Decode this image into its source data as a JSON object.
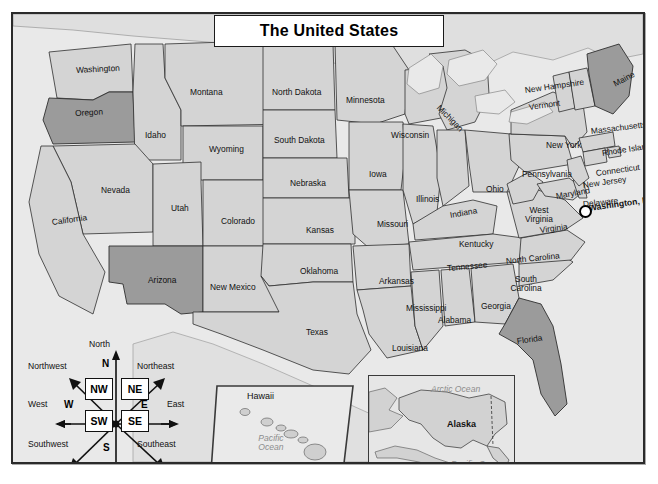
{
  "title": "The United States",
  "map": {
    "frame_color": "#2b2b2b",
    "ocean_color": "#e9e9e9",
    "land_color": "#d4d4d4",
    "highlight_color": "#9b9b9b",
    "highlighted_states": [
      "Oregon",
      "Arizona",
      "Maine",
      "Florida"
    ]
  },
  "states": [
    {
      "name": "Washington",
      "x": 63,
      "y": 52,
      "rot": -3
    },
    {
      "name": "Oregon",
      "x": 62,
      "y": 95,
      "rot": -3
    },
    {
      "name": "Idaho",
      "x": 132,
      "y": 117,
      "rot": 0
    },
    {
      "name": "Montana",
      "x": 177,
      "y": 74,
      "rot": 0
    },
    {
      "name": "Wyoming",
      "x": 196,
      "y": 131,
      "rot": 0
    },
    {
      "name": "Nevada",
      "x": 88,
      "y": 172,
      "rot": 0
    },
    {
      "name": "California",
      "x": 39,
      "y": 204,
      "rot": -8
    },
    {
      "name": "Utah",
      "x": 158,
      "y": 190,
      "rot": 0
    },
    {
      "name": "Colorado",
      "x": 208,
      "y": 203,
      "rot": 0
    },
    {
      "name": "Arizona",
      "x": 135,
      "y": 262,
      "rot": 0
    },
    {
      "name": "New Mexico",
      "x": 197,
      "y": 269,
      "rot": 0
    },
    {
      "name": "North Dakota",
      "x": 259,
      "y": 74,
      "rot": 0
    },
    {
      "name": "South Dakota",
      "x": 261,
      "y": 122,
      "rot": 0
    },
    {
      "name": "Nebraska",
      "x": 277,
      "y": 165,
      "rot": 0
    },
    {
      "name": "Kansas",
      "x": 293,
      "y": 212,
      "rot": 0
    },
    {
      "name": "Oklahoma",
      "x": 287,
      "y": 253,
      "rot": 0
    },
    {
      "name": "Texas",
      "x": 293,
      "y": 314,
      "rot": 0
    },
    {
      "name": "Minnesota",
      "x": 333,
      "y": 82,
      "rot": 0
    },
    {
      "name": "Iowa",
      "x": 356,
      "y": 156,
      "rot": 0
    },
    {
      "name": "Missouri",
      "x": 364,
      "y": 206,
      "rot": 0
    },
    {
      "name": "Arkansas",
      "x": 366,
      "y": 263,
      "rot": 0
    },
    {
      "name": "Louisiana",
      "x": 379,
      "y": 330,
      "rot": 0
    },
    {
      "name": "Wisconsin",
      "x": 378,
      "y": 117,
      "rot": 0
    },
    {
      "name": "Illinois",
      "x": 403,
      "y": 181,
      "rot": 0
    },
    {
      "name": "Michigan",
      "x": 425,
      "y": 88,
      "rot": 45
    },
    {
      "name": "Indiana",
      "x": 437,
      "y": 197,
      "rot": -10
    },
    {
      "name": "Ohio",
      "x": 473,
      "y": 171,
      "rot": 0
    },
    {
      "name": "Kentucky",
      "x": 446,
      "y": 226,
      "rot": 0
    },
    {
      "name": "Tennessee",
      "x": 434,
      "y": 250,
      "rot": -5
    },
    {
      "name": "Mississippi",
      "x": 393,
      "y": 290,
      "rot": 0
    },
    {
      "name": "Alabama",
      "x": 425,
      "y": 302,
      "rot": 0
    },
    {
      "name": "Georgia",
      "x": 468,
      "y": 288,
      "rot": 0
    },
    {
      "name": "Florida",
      "x": 504,
      "y": 323,
      "rot": -8
    },
    {
      "name": "South Carolina",
      "x": 492,
      "y": 261,
      "rot": 0,
      "two": true
    },
    {
      "name": "North Carolina",
      "x": 493,
      "y": 243,
      "rot": -6
    },
    {
      "name": "Virginia",
      "x": 527,
      "y": 212,
      "rot": -8
    },
    {
      "name": "West Virginia",
      "x": 505,
      "y": 192,
      "rot": 0,
      "two": true
    },
    {
      "name": "Pennsylvania",
      "x": 509,
      "y": 156,
      "rot": 0
    },
    {
      "name": "Maryland",
      "x": 543,
      "y": 178,
      "rot": -10
    },
    {
      "name": "Delaware",
      "x": 570,
      "y": 186,
      "rot": -6
    },
    {
      "name": "New Jersey",
      "x": 570,
      "y": 167,
      "rot": -8
    },
    {
      "name": "New York",
      "x": 533,
      "y": 127,
      "rot": 0
    },
    {
      "name": "Connecticut",
      "x": 583,
      "y": 155,
      "rot": -8
    },
    {
      "name": "Rhode Island",
      "x": 589,
      "y": 135,
      "rot": -9
    },
    {
      "name": "Massachusetts",
      "x": 578,
      "y": 113,
      "rot": -7
    },
    {
      "name": "Vermont",
      "x": 516,
      "y": 89,
      "rot": -8
    },
    {
      "name": "New Hampshire",
      "x": 512,
      "y": 72,
      "rot": -8
    },
    {
      "name": "Maine",
      "x": 601,
      "y": 66,
      "rot": -28
    }
  ],
  "capital": {
    "label": "Washington, D.C.",
    "x": 576,
    "y": 190,
    "marker_x": 566,
    "marker_y": 191
  },
  "compass": {
    "boxes": [
      {
        "label": "NW",
        "x": 58,
        "y": 42
      },
      {
        "label": "NE",
        "x": 94,
        "y": 42
      },
      {
        "label": "SW",
        "x": 58,
        "y": 74
      },
      {
        "label": "SE",
        "x": 94,
        "y": 74
      }
    ],
    "letters": [
      {
        "label": "N",
        "x": 75,
        "y": 22
      },
      {
        "label": "S",
        "x": 76,
        "y": 106
      },
      {
        "label": "W",
        "x": 37,
        "y": 63
      },
      {
        "label": "E",
        "x": 114,
        "y": 63
      }
    ],
    "directions": [
      {
        "label": "North",
        "x": 62,
        "y": 3
      },
      {
        "label": "South",
        "x": 60,
        "y": 132
      },
      {
        "label": "West",
        "x": 1,
        "y": 63
      },
      {
        "label": "East",
        "x": 140,
        "y": 63
      },
      {
        "label": "Northwest",
        "x": 1,
        "y": 25
      },
      {
        "label": "Northeast",
        "x": 110,
        "y": 25
      },
      {
        "label": "Southwest",
        "x": 1,
        "y": 103
      },
      {
        "label": "Southeast",
        "x": 110,
        "y": 103
      }
    ]
  },
  "insets": [
    {
      "name": "Hawaii",
      "label": "Hawaii",
      "ocean": "Pacific Ocean"
    },
    {
      "name": "Alaska",
      "label": "Alaska",
      "ocean_north": "Arctic Ocean",
      "ocean_south": "Pacific Ocean"
    }
  ]
}
